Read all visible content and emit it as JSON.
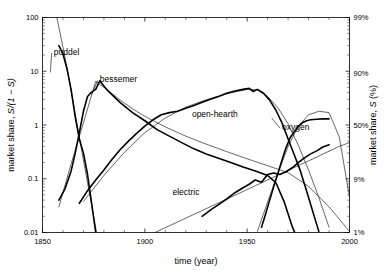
{
  "chart_data": {
    "type": "line",
    "title": "",
    "subtitle": "",
    "xlabel": "time (year)",
    "ylabel": "market share, S/(1 − S)",
    "ylabel_right": "market share, S (%)",
    "xlim": [
      1850,
      2000
    ],
    "ylim": [
      0.01,
      100
    ],
    "yscale": "log",
    "xscale": "linear",
    "grid": false,
    "legend": "inline-annotations",
    "xticks": [
      1850,
      1900,
      1950,
      2000
    ],
    "xticklabels": [
      "1850",
      "1900",
      "1950",
      "2000"
    ],
    "yticks": [
      0.01,
      0.1,
      1,
      10,
      100
    ],
    "yticklabels": [
      "0.01",
      "0.1",
      "1",
      "10",
      "100"
    ],
    "yticks_right": [
      0.01,
      0.0989,
      1,
      9,
      99
    ],
    "yticklabels_right": [
      "1%",
      "9%",
      "50%",
      "90%",
      "99%"
    ],
    "annotations": [
      {
        "text": "puddel",
        "x": 1855.5,
        "y": 20.0,
        "leader_to_x": 1853.8,
        "leader_to_y": 9.5
      },
      {
        "text": "bessemer",
        "x": 1878.0,
        "y": 6.2,
        "leader_to_x": 1874.0,
        "leader_to_y": 3.7
      },
      {
        "text": "open-hearth",
        "x": 1923.0,
        "y": 1.42,
        "leader_to_x": null,
        "leader_to_y": null
      },
      {
        "text": "electric",
        "x": 1913.5,
        "y": 0.049,
        "leader_to_x": null,
        "leader_to_y": null
      },
      {
        "text": "oxygen",
        "x": 1967.0,
        "y": 0.8,
        "leader_to_x": 1962.0,
        "leader_to_y": 1.35
      }
    ],
    "series": [
      {
        "name": "puddel",
        "kind": "data",
        "x": [
          1858,
          1860,
          1862,
          1864,
          1866,
          1868,
          1870,
          1872,
          1874,
          1876
        ],
        "values": [
          30.0,
          21.0,
          11.0,
          4.5,
          1.4,
          0.55,
          0.3,
          0.12,
          0.035,
          0.01
        ]
      },
      {
        "name": "puddel-fit",
        "kind": "fit",
        "x": [
          1857,
          1860,
          1863,
          1866,
          1869,
          1872,
          1875,
          1878
        ],
        "values": [
          100.0,
          28.0,
          7.0,
          1.6,
          0.36,
          0.085,
          0.02,
          0.0046
        ]
      },
      {
        "name": "bessemer",
        "kind": "data",
        "x": [
          1858,
          1861,
          1864,
          1866,
          1868,
          1870,
          1872,
          1874,
          1876,
          1878,
          1882,
          1888,
          1894,
          1900,
          1906,
          1912,
          1918,
          1924,
          1930,
          1936,
          1942,
          1948,
          1954,
          1960,
          1964,
          1968,
          1972,
          1974
        ],
        "values": [
          0.04,
          0.065,
          0.14,
          0.3,
          0.72,
          1.8,
          3.4,
          4.1,
          4.6,
          6.6,
          4.3,
          2.6,
          1.7,
          1.2,
          0.82,
          0.62,
          0.47,
          0.36,
          0.29,
          0.24,
          0.2,
          0.165,
          0.14,
          0.115,
          0.085,
          0.038,
          0.013,
          0.0085
        ]
      },
      {
        "name": "bessemer-fit",
        "kind": "fit",
        "x": [
          1858,
          1864,
          1870,
          1876,
          1882,
          1888,
          1894,
          1900,
          1910,
          1920,
          1930,
          1940,
          1950,
          1960,
          1970,
          1980,
          1990,
          2000
        ],
        "values": [
          0.03,
          0.19,
          1.1,
          6.5,
          4.4,
          2.9,
          2.0,
          1.45,
          0.92,
          0.62,
          0.44,
          0.32,
          0.235,
          0.175,
          0.13,
          0.072,
          0.03,
          0.0105
        ]
      },
      {
        "name": "open-hearth",
        "kind": "data",
        "x": [
          1868,
          1872,
          1876,
          1880,
          1884,
          1888,
          1892,
          1896,
          1900,
          1904,
          1908,
          1912,
          1916,
          1920,
          1924,
          1928,
          1932,
          1936,
          1940,
          1944,
          1948,
          1951,
          1953,
          1955,
          1958,
          1961,
          1964,
          1967,
          1970,
          1973,
          1976,
          1979,
          1982,
          1985
        ],
        "values": [
          0.035,
          0.06,
          0.095,
          0.145,
          0.23,
          0.35,
          0.5,
          0.7,
          0.95,
          1.25,
          1.55,
          1.7,
          1.8,
          2.05,
          2.3,
          2.65,
          3.0,
          3.4,
          3.9,
          4.3,
          4.6,
          4.8,
          4.2,
          4.6,
          3.9,
          2.9,
          1.9,
          1.1,
          0.55,
          0.28,
          0.14,
          0.06,
          0.025,
          0.0105
        ]
      },
      {
        "name": "open-hearth-fit",
        "kind": "fit",
        "x": [
          1870,
          1880,
          1890,
          1900,
          1910,
          1920,
          1930,
          1940,
          1950,
          1955,
          1960,
          1965,
          1970,
          1975,
          1980,
          1985,
          1990
        ],
        "values": [
          0.038,
          0.115,
          0.31,
          0.72,
          1.35,
          2.15,
          2.95,
          3.8,
          4.6,
          4.5,
          3.4,
          2.1,
          1.05,
          0.42,
          0.145,
          0.045,
          0.0125
        ]
      },
      {
        "name": "electric",
        "kind": "data",
        "x": [
          1928,
          1932,
          1936,
          1940,
          1944,
          1948,
          1951,
          1954,
          1957,
          1960,
          1963,
          1966,
          1969,
          1972,
          1975,
          1978,
          1981,
          1984,
          1987,
          1990
        ],
        "values": [
          0.02,
          0.026,
          0.033,
          0.042,
          0.055,
          0.068,
          0.079,
          0.095,
          0.086,
          0.12,
          0.128,
          0.12,
          0.135,
          0.16,
          0.2,
          0.245,
          0.29,
          0.33,
          0.39,
          0.43
        ]
      },
      {
        "name": "electric-fit",
        "kind": "fit",
        "x": [
          1905,
          1920,
          1935,
          1950,
          1965,
          1980,
          1995,
          2000
        ],
        "values": [
          0.01,
          0.0185,
          0.034,
          0.063,
          0.117,
          0.215,
          0.4,
          0.47
        ]
      },
      {
        "name": "oxygen",
        "kind": "data",
        "x": [
          1957,
          1959,
          1961,
          1963,
          1965,
          1967,
          1969,
          1971,
          1973,
          1975,
          1977,
          1979,
          1981,
          1984,
          1987,
          1990
        ],
        "values": [
          0.0125,
          0.022,
          0.04,
          0.072,
          0.125,
          0.22,
          0.38,
          0.58,
          0.75,
          0.95,
          1.1,
          1.2,
          1.25,
          1.28,
          1.3,
          1.3
        ]
      },
      {
        "name": "oxygen-fit",
        "kind": "fit",
        "x": [
          1955,
          1960,
          1965,
          1970,
          1975,
          1980,
          1985,
          1990,
          1995,
          2000
        ],
        "values": [
          0.0105,
          0.037,
          0.125,
          0.4,
          0.95,
          1.55,
          1.8,
          1.7,
          0.6,
          0.045
        ]
      }
    ]
  },
  "axes": {
    "left_title_prefix": "market share, ",
    "left_title_math": "S/(1 − S)",
    "right_title_prefix": "market share, ",
    "right_title_math": "S",
    "right_title_suffix": " (%)",
    "x_title": "time (year)"
  },
  "colors": {
    "line": "#000000",
    "frame": "#000000",
    "background": "#ffffff"
  }
}
